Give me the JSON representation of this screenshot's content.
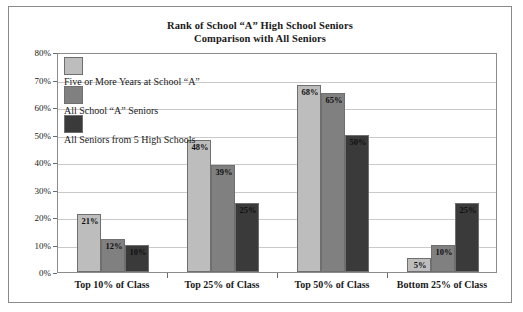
{
  "chart_data": {
    "type": "bar",
    "title": "Rank of School “A” High School Seniors",
    "subtitle": "Comparison with All Seniors",
    "xlabel": "",
    "ylabel": "",
    "ylim": [
      0,
      80
    ],
    "grid": true,
    "legend_position": "inside-top-left",
    "categories": [
      "Top 10% of Class",
      "Top 25% of Class",
      "Top 50% of Class",
      "Bottom 25% of Class"
    ],
    "series": [
      {
        "name": "Five or More Years at School “A”",
        "color": "#bdbdbd",
        "values": [
          21,
          48,
          68,
          5
        ],
        "labels": [
          "21%",
          "48%",
          "68%",
          "5%"
        ]
      },
      {
        "name": "All School “A” Seniors",
        "color": "#808080",
        "values": [
          12,
          39,
          65,
          10
        ],
        "labels": [
          "12%",
          "39%",
          "65%",
          "10%"
        ]
      },
      {
        "name": "All Seniors from 5 High Schools",
        "color": "#3a3a3a",
        "values": [
          10,
          25,
          50,
          25
        ],
        "labels": [
          "10%",
          "25%",
          "50%",
          "25%"
        ]
      }
    ],
    "yticks": [
      "0%",
      "10%",
      "20%",
      "30%",
      "40%",
      "50%",
      "60%",
      "70%",
      "80%"
    ],
    "ytick_values": [
      0,
      10,
      20,
      30,
      40,
      50,
      60,
      70,
      80
    ]
  }
}
